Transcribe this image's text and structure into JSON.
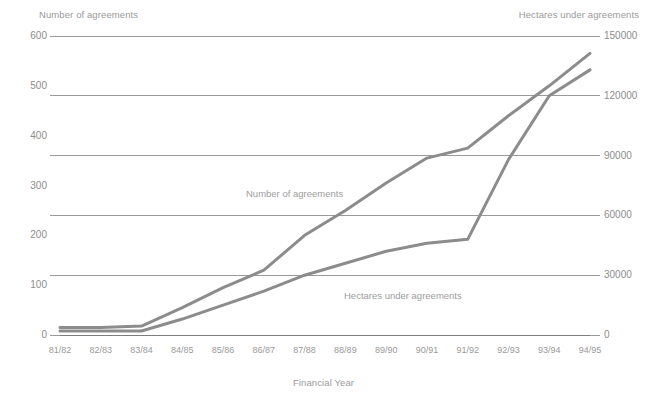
{
  "chart_data": {
    "type": "line",
    "title": "",
    "xlabel": "Financial Year",
    "categories": [
      "81/82",
      "82/83",
      "83/84",
      "84/85",
      "85/86",
      "86/87",
      "87/88",
      "88/89",
      "89/90",
      "90/91",
      "91/92",
      "92/93",
      "93/94",
      "94/95"
    ],
    "grid": true,
    "legend_position": "inline-annotations",
    "axes": {
      "left": {
        "label": "Number of agreements",
        "ticks": [
          0,
          100,
          200,
          300,
          400,
          500,
          600
        ],
        "ylim": [
          0,
          600
        ]
      },
      "right": {
        "label": "Hectares under agreements",
        "ticks": [
          0,
          30000,
          60000,
          90000,
          120000,
          150000
        ],
        "ylim": [
          0,
          150000
        ]
      }
    },
    "series": [
      {
        "name": "Number of agreements",
        "axis": "left",
        "color": "#8c8c8c",
        "values": [
          15,
          15,
          18,
          55,
          95,
          130,
          200,
          250,
          305,
          355,
          375,
          440,
          500,
          565
        ]
      },
      {
        "name": "Hectares under agreements",
        "axis": "right",
        "color": "#8c8c8c",
        "values": [
          2000,
          2000,
          2000,
          8000,
          15000,
          22000,
          30000,
          36000,
          42000,
          46000,
          48000,
          88000,
          120000,
          133000
        ]
      }
    ],
    "annotations": [
      {
        "text": "Number of agreements",
        "series": "Number of agreements"
      },
      {
        "text": "Hectares under agreements",
        "series": "Hectares under agreements"
      }
    ],
    "colors": {
      "background": "#ffffff",
      "gridline": "#6f6f6f",
      "line": "#8c8c8c",
      "text": "#909090"
    }
  },
  "labels": {
    "left_axis_title": "Number of agreements",
    "right_axis_title": "Hectares under agreements",
    "x_axis_title": "Financial Year",
    "series_label_agreements": "Number of agreements",
    "series_label_hectares": "Hectares under agreements"
  },
  "left_ticks": [
    "600",
    "500",
    "400",
    "300",
    "200",
    "100",
    "0"
  ],
  "right_ticks": [
    "150000",
    "120000",
    "90000",
    "60000",
    "30000",
    "0"
  ],
  "x_ticks": [
    "81/82",
    "82/83",
    "83/84",
    "84/85",
    "85/86",
    "86/87",
    "87/88",
    "88/89",
    "89/90",
    "90/91",
    "91/92",
    "92/93",
    "93/94",
    "94/95"
  ]
}
